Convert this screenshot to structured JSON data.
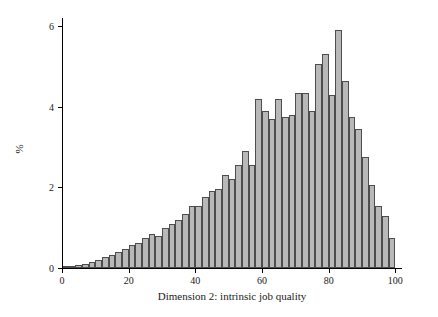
{
  "chart_data": {
    "type": "bar",
    "title": "",
    "subtitle": "",
    "xlabel": "Dimension 2: intrinsic job quality",
    "ylabel": "%",
    "xlim": [
      0,
      102
    ],
    "ylim": [
      0,
      6.2
    ],
    "grid": false,
    "legend": null,
    "xticks": [
      0,
      20,
      40,
      60,
      80,
      100
    ],
    "yticks": [
      0,
      2,
      4,
      6
    ],
    "bin_width": 2,
    "bar_color": "#b8b8b8",
    "bar_edge_color": "#4d4d4d",
    "axis_color": "#000000",
    "background_color": "#ffffff",
    "categories": [
      1,
      3,
      5,
      7,
      9,
      11,
      13,
      15,
      17,
      19,
      21,
      23,
      25,
      27,
      29,
      31,
      33,
      35,
      37,
      39,
      41,
      43,
      45,
      47,
      49,
      51,
      53,
      55,
      57,
      59,
      61,
      63,
      65,
      67,
      69,
      71,
      73,
      75,
      77,
      79,
      81,
      83,
      85,
      87,
      89,
      91,
      93,
      95,
      97,
      99
    ],
    "values": [
      0.03,
      0.05,
      0.08,
      0.1,
      0.14,
      0.2,
      0.27,
      0.32,
      0.4,
      0.46,
      0.56,
      0.62,
      0.75,
      0.85,
      0.8,
      1.0,
      1.1,
      1.2,
      1.35,
      1.55,
      1.55,
      1.75,
      1.9,
      1.95,
      2.3,
      2.2,
      2.55,
      2.9,
      2.55,
      4.2,
      3.9,
      3.7,
      4.2,
      3.75,
      3.8,
      4.35,
      4.35,
      3.9,
      5.05,
      5.3,
      4.3,
      5.9,
      4.65,
      3.75,
      3.45,
      2.75,
      2.05,
      1.55,
      1.3,
      0.75
    ]
  }
}
